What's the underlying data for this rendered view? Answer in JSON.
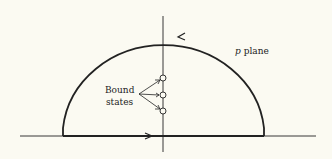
{
  "diagram": {
    "plane_label_var": "p",
    "plane_label_text": " plane",
    "bound_label_line1": "Bound",
    "bound_label_line2": "states",
    "colors": {
      "background": "#fbfaf2",
      "ink": "#222222"
    }
  }
}
